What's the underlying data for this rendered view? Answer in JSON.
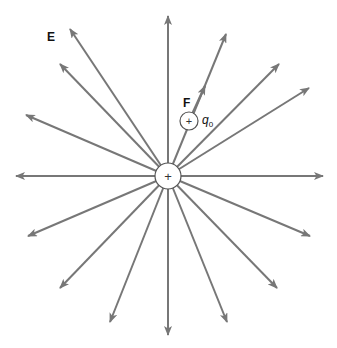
{
  "diagram": {
    "field_label": "E",
    "force_label": "F",
    "test_charge_label": "q",
    "test_charge_subscript": "0",
    "source_charge_sign": "+",
    "test_charge_sign": "+",
    "colors": {
      "arrow": "#777777",
      "circle_stroke": "#555555",
      "text": "#111111"
    },
    "center": [
      168,
      176
    ],
    "source_radius": 13,
    "test_charge": {
      "center": [
        189,
        121
      ],
      "radius": 9
    },
    "field_lines": [
      {
        "angle": 0,
        "tip": [
          323,
          176
        ]
      },
      {
        "angle": 22.5,
        "tip": [
          309,
          88
        ]
      },
      {
        "angle": 45,
        "tip": [
          279,
          64
        ]
      },
      {
        "angle": 67.5,
        "tip": [
          226,
          34
        ]
      },
      {
        "angle": 90,
        "tip": [
          168,
          16
        ]
      },
      {
        "angle": 112.5,
        "tip": [
          70,
          29
        ]
      },
      {
        "angle": 135,
        "tip": [
          60,
          64
        ]
      },
      {
        "angle": 157.5,
        "tip": [
          26,
          115
        ]
      },
      {
        "angle": 180,
        "tip": [
          16,
          176
        ]
      },
      {
        "angle": 202.5,
        "tip": [
          28,
          236
        ]
      },
      {
        "angle": 225,
        "tip": [
          60,
          288
        ]
      },
      {
        "angle": 247.5,
        "tip": [
          110,
          322
        ]
      },
      {
        "angle": 270,
        "tip": [
          168,
          335
        ]
      },
      {
        "angle": 292.5,
        "tip": [
          227,
          322
        ]
      },
      {
        "angle": 315,
        "tip": [
          277,
          288
        ]
      },
      {
        "angle": 337.5,
        "tip": [
          310,
          236
        ]
      }
    ]
  }
}
